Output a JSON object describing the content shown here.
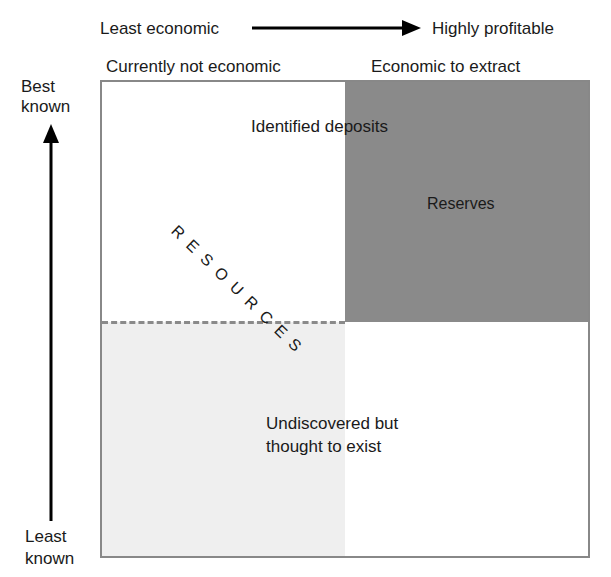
{
  "diagram": {
    "axes": {
      "horizontal": {
        "start_label": "Least economic",
        "end_label": "Highly profitable"
      },
      "vertical": {
        "top_label_line1": "Best",
        "top_label_line2": "known",
        "bottom_label_line1": "Least",
        "bottom_label_line2": "known"
      }
    },
    "column_headers": {
      "left": "Currently not economic",
      "right": "Economic to extract"
    },
    "regions": {
      "identified": "Identified deposits",
      "reserves": "Reserves",
      "resources": "RESOURCES",
      "undiscovered_line1": "Undiscovered but",
      "undiscovered_line2": "thought to exist"
    },
    "colors": {
      "reserves_fill": "#8a8a8a",
      "undiscovered_fill": "#efefef",
      "border": "#888888",
      "arrow": "#000000"
    }
  }
}
